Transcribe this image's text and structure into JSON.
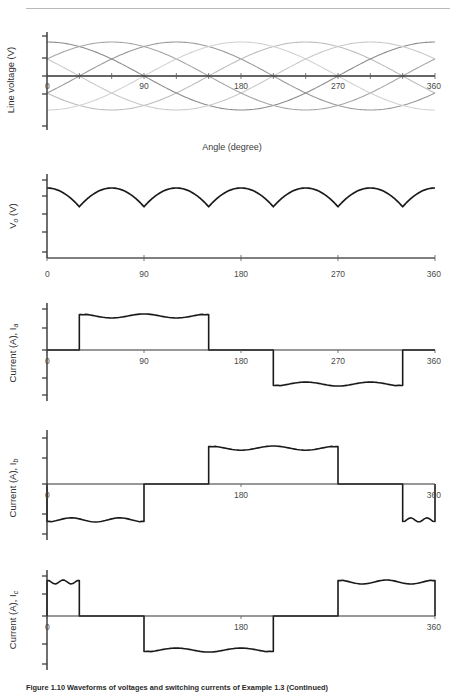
{
  "header": {
    "running_head": ""
  },
  "caption": {
    "text": "Figure 1.10 Waveforms of voltages and switching currents of Example 1.3 (Continued)"
  },
  "axes_common": {
    "xlabel": "Angle (degree)",
    "xticks": [
      0,
      90,
      180,
      270,
      360
    ],
    "xtick_labels": [
      "0",
      "90",
      "180",
      "270",
      "360"
    ],
    "xlim": [
      0,
      360
    ],
    "grid": false,
    "legend": false
  },
  "chart_data": [
    {
      "id": "line-voltage",
      "type": "line",
      "title": "",
      "xlabel": "Angle (degree)",
      "ylabel": "Line voltage (V)",
      "xlim": [
        0,
        360
      ],
      "ylim": [
        -1.15,
        1.15
      ],
      "xticks": [
        0,
        90,
        180,
        270,
        360
      ],
      "xtick_labels": [
        "0",
        "90",
        "180",
        "270",
        "360"
      ],
      "minor_xticks": [
        30,
        60,
        120,
        150,
        210,
        240,
        300,
        330
      ],
      "grid": false,
      "legend": false,
      "series": [
        {
          "name": "Vab",
          "color": "#9a9a9a",
          "phase_deg": 30,
          "amplitude": 1.0
        },
        {
          "name": "Vbc",
          "color": "#bdbdbd",
          "phase_deg": 150,
          "amplitude": 1.0
        },
        {
          "name": "Vca",
          "color": "#8c8c8c",
          "phase_deg": 270,
          "amplitude": 1.0
        },
        {
          "name": "Vba",
          "color": "#c9c9c9",
          "phase_deg": 210,
          "amplitude": 1.0
        },
        {
          "name": "Vcb",
          "color": "#a6a6a6",
          "phase_deg": 330,
          "amplitude": 1.0
        },
        {
          "name": "Vac",
          "color": "#d2d2d2",
          "phase_deg": 90,
          "amplitude": 1.0
        }
      ]
    },
    {
      "id": "output-voltage",
      "type": "line",
      "title": "",
      "xlabel": "",
      "ylabel": "V_o (V)",
      "ylabel_main": "V",
      "ylabel_sub": "o",
      "ylabel_unit": " (V)",
      "xlim": [
        0,
        360
      ],
      "ylim": [
        0,
        1.12
      ],
      "xticks": [
        0,
        90,
        180,
        270,
        360
      ],
      "xtick_labels": [
        "0",
        "90",
        "180",
        "270",
        "360"
      ],
      "grid": false,
      "legend": false,
      "waveform": "six-pulse-rectified",
      "pulse_count": 6,
      "peak_value": 1.0,
      "valley_value": 0.5,
      "valley_angles": [
        30,
        90,
        150,
        210,
        270,
        330
      ],
      "peak_angles": [
        0,
        60,
        120,
        180,
        240,
        300,
        360
      ]
    },
    {
      "id": "current-a",
      "type": "line",
      "title": "",
      "xlabel": "",
      "ylabel": "Current (A), I_a",
      "ylabel_main": "Current (A), I",
      "ylabel_sub": "a",
      "xlim": [
        0,
        360
      ],
      "ylim": [
        -1.25,
        1.25
      ],
      "xticks": [
        0,
        90,
        180,
        270,
        360
      ],
      "xtick_labels": [
        "0",
        "90",
        "180",
        "270",
        "360"
      ],
      "grid": false,
      "legend": false,
      "waveform": "quasi-square-120",
      "positive_block": [
        30,
        150
      ],
      "negative_block": [
        210,
        330
      ],
      "block_level": 1.0,
      "ripple_dip": 0.88
    },
    {
      "id": "current-b",
      "type": "line",
      "title": "",
      "xlabel": "",
      "ylabel": "Current (A), I_b",
      "ylabel_main": "Current (A), I",
      "ylabel_sub": "b",
      "xlim": [
        0,
        360
      ],
      "ylim": [
        -1.25,
        1.25
      ],
      "xticks": [
        0,
        180,
        360
      ],
      "xtick_labels": [
        "0",
        "180",
        "360"
      ],
      "grid": false,
      "legend": false,
      "waveform": "quasi-square-120",
      "negative_block_start": [
        0,
        90
      ],
      "positive_block": [
        150,
        270
      ],
      "negative_block_end": [
        330,
        360
      ],
      "block_level": 1.0,
      "ripple_dip": 0.88
    },
    {
      "id": "current-c",
      "type": "line",
      "title": "",
      "xlabel": "",
      "ylabel": "Current (A), I_c",
      "ylabel_main": "Current (A), I",
      "ylabel_sub": "c",
      "xlim": [
        0,
        360
      ],
      "ylim": [
        -1.25,
        1.25
      ],
      "xticks": [
        0,
        180,
        360
      ],
      "xtick_labels": [
        "0",
        "180",
        "360"
      ],
      "grid": false,
      "legend": false,
      "waveform": "quasi-square-120",
      "positive_block_start": [
        0,
        30
      ],
      "negative_block": [
        90,
        210
      ],
      "positive_block_end": [
        270,
        360
      ],
      "block_level": 1.0,
      "ripple_dip": 0.88
    }
  ]
}
